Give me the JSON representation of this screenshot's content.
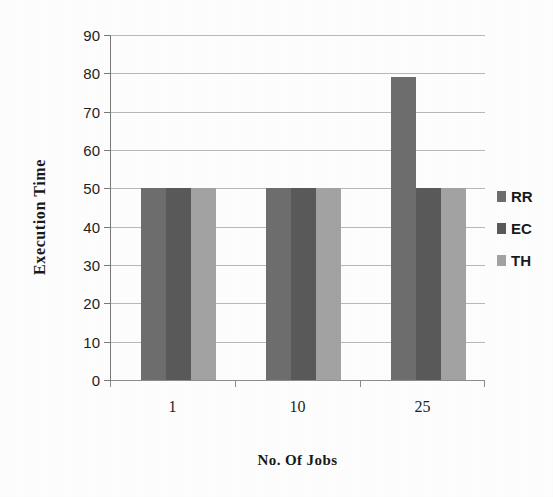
{
  "chart_data": {
    "type": "bar",
    "title": "",
    "xlabel": "No. Of Jobs",
    "ylabel": "Execution Time",
    "categories": [
      "1",
      "10",
      "25"
    ],
    "series": [
      {
        "name": "RR",
        "values": [
          50,
          50,
          79
        ],
        "color": "#6e6e6e"
      },
      {
        "name": "EC",
        "values": [
          50,
          50,
          50
        ],
        "color": "#5a5a5a"
      },
      {
        "name": "TH",
        "values": [
          50,
          50,
          50
        ],
        "color": "#a3a3a3"
      }
    ],
    "ylim": [
      0,
      90
    ],
    "yticks": [
      0,
      10,
      20,
      30,
      40,
      50,
      60,
      70,
      80,
      90
    ],
    "ytick_labels": [
      "0",
      "10",
      "20",
      "30",
      "40",
      "50",
      "60",
      "70",
      "80",
      "90"
    ],
    "grid": true,
    "grid_axis": "y",
    "legend_position": "right",
    "bar_group_gap": true
  },
  "axes": {
    "y_title": "Execution Time",
    "x_title": "No. Of Jobs"
  },
  "legend": {
    "entries": [
      {
        "label": "RR",
        "color": "#6e6e6e"
      },
      {
        "label": "EC",
        "color": "#5a5a5a"
      },
      {
        "label": "TH",
        "color": "#a3a3a3"
      }
    ]
  },
  "colors": {
    "background": "#ffffff",
    "gridline": "#b9b9b9",
    "axis": "#7a7a7a",
    "text": "#1a1a1a"
  }
}
